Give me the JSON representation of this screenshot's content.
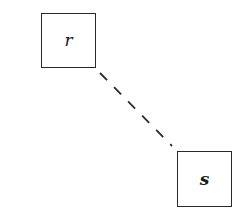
{
  "diagram": {
    "nodes": [
      {
        "id": "r",
        "label": "r",
        "x": 41,
        "y": 13,
        "width": 55,
        "height": 55
      },
      {
        "id": "s",
        "label": "s",
        "x": 177,
        "y": 151,
        "width": 55,
        "height": 56
      }
    ],
    "edges": [
      {
        "from": "r",
        "to": "s",
        "style": "dashed",
        "x1": 100,
        "y1": 73,
        "x2": 172,
        "y2": 146
      }
    ],
    "colors": {
      "stroke": "#2a2a2a",
      "background": "#ffffff"
    }
  }
}
